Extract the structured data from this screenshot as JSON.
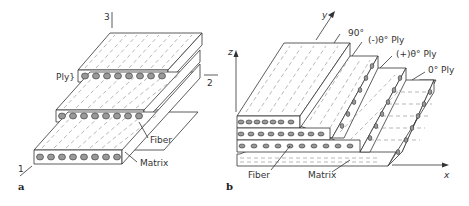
{
  "figure_a": {
    "panel_label": "a",
    "axes": {
      "axis1": "1",
      "axis2": "2",
      "axis3": "3"
    },
    "labels": {
      "ply": "Ply}",
      "fiber": "Fiber",
      "matrix": "Matrix"
    }
  },
  "figure_b": {
    "panel_label": "b",
    "axes": {
      "x": "x",
      "y": "y",
      "z": "z"
    },
    "labels": {
      "ply_90": "90°",
      "ply_minus_theta": "(-)θ° Ply",
      "ply_plus_theta": "(+)θ° Ply",
      "ply_0": "0° Ply",
      "fiber": "Fiber",
      "matrix": "Matrix"
    }
  }
}
